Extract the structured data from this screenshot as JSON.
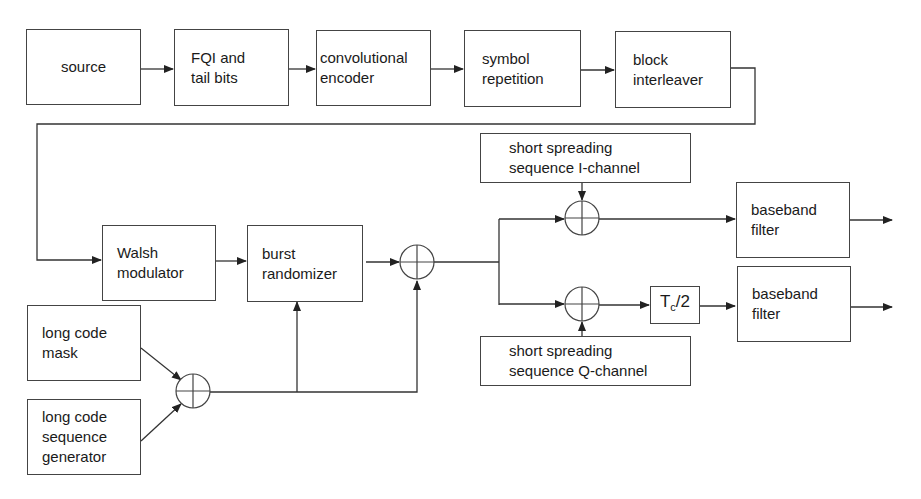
{
  "diagram": {
    "type": "block-diagram",
    "blocks": {
      "source": "source",
      "fqi": "FQI and\ntail bits",
      "conv": "convolutional\nencoder",
      "symrep": "symbol\nrepetition",
      "interleaver": "block\ninterleaver",
      "walsh": "Walsh\nmodulator",
      "burst": "burst\nrandomizer",
      "lcmask": "long code\nmask",
      "lcgen": "long code\nsequence\ngenerator",
      "ich": "short spreading\nsequence I-channel",
      "qch": "short spreading\nsequence Q-channel",
      "delay_main": "T",
      "delay_sub": "c",
      "delay_tail": "/2",
      "bbf_i": "baseband\nfilter",
      "bbf_q": "baseband\nfilter"
    },
    "adders": [
      "xor-longcode",
      "xor-scramble",
      "xor-i",
      "xor-q"
    ],
    "colors": {
      "line": "#333333",
      "box_border": "#444444",
      "background": "#ffffff"
    }
  }
}
